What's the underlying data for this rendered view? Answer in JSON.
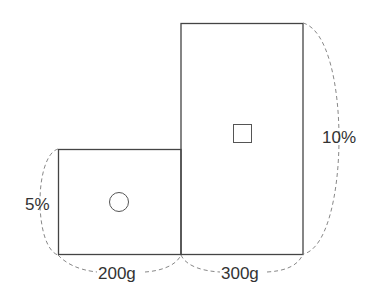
{
  "diagram": {
    "type": "area-model",
    "left_block": {
      "width_label": "200g",
      "height_label": "5%",
      "symbol": "circle"
    },
    "right_block": {
      "width_label": "300g",
      "height_label": "10%",
      "symbol": "square"
    },
    "colors": {
      "line": "#444444",
      "dashed": "#888888",
      "text": "#333333",
      "background": "#ffffff"
    }
  }
}
